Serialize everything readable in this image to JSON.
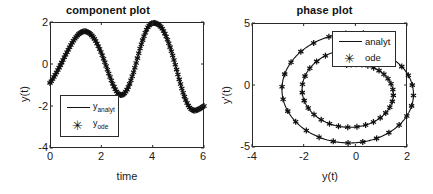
{
  "figure": {
    "background_color": "#ffffff",
    "line_color": "#111111",
    "marker_glyph": "✳"
  },
  "chart_data": [
    {
      "type": "line",
      "id": "component-plot",
      "title": "component plot",
      "xlabel": "time",
      "ylabel": "y(t)",
      "xlim": [
        0,
        6
      ],
      "ylim": [
        -4,
        2
      ],
      "xticks": [
        0,
        2,
        4,
        6
      ],
      "yticks": [
        -4,
        -2,
        0,
        2
      ],
      "grid": false,
      "legend": {
        "position": "lower-left-inside",
        "entries": [
          {
            "label": "y",
            "sub": "analyt",
            "style": "line"
          },
          {
            "label": "y",
            "sub": "ode",
            "style": "marker"
          }
        ]
      },
      "description": "Damped-amplitude growing oscillation y(t) starting near -0.9 at t=0, peaking ~1.55 at t=1.3, trough ~-1.45 at t=2.8, peak ~1.95 at t=4.25, trough ~-2.2 at t=5.8, ending ~-2.0 at t=6",
      "series": [
        {
          "name": "y_analyt",
          "style": "line",
          "x": [
            0.0,
            0.1,
            0.2,
            0.3,
            0.4,
            0.5,
            0.6,
            0.7,
            0.8,
            0.9,
            1.0,
            1.1,
            1.2,
            1.3,
            1.4,
            1.5,
            1.6,
            1.7,
            1.8,
            1.9,
            2.0,
            2.1,
            2.2,
            2.3,
            2.4,
            2.5,
            2.6,
            2.7,
            2.8,
            2.9,
            3.0,
            3.1,
            3.2,
            3.3,
            3.4,
            3.5,
            3.6,
            3.7,
            3.8,
            3.9,
            4.0,
            4.1,
            4.2,
            4.3,
            4.4,
            4.5,
            4.6,
            4.7,
            4.8,
            4.9,
            5.0,
            5.1,
            5.2,
            5.3,
            5.4,
            5.5,
            5.6,
            5.7,
            5.8,
            5.9,
            6.0
          ],
          "y": [
            -0.9,
            -0.72,
            -0.52,
            -0.3,
            -0.07,
            0.17,
            0.42,
            0.65,
            0.88,
            1.08,
            1.26,
            1.4,
            1.5,
            1.55,
            1.55,
            1.5,
            1.4,
            1.25,
            1.05,
            0.8,
            0.52,
            0.2,
            -0.14,
            -0.49,
            -0.82,
            -1.1,
            -1.32,
            -1.45,
            -1.48,
            -1.4,
            -1.22,
            -0.95,
            -0.6,
            -0.2,
            0.25,
            0.7,
            1.1,
            1.45,
            1.72,
            1.88,
            1.95,
            1.95,
            1.9,
            1.8,
            1.62,
            1.38,
            1.08,
            0.72,
            0.32,
            -0.12,
            -0.58,
            -1.02,
            -1.42,
            -1.75,
            -2.0,
            -2.15,
            -2.22,
            -2.2,
            -2.15,
            -2.08,
            -2.0
          ]
        },
        {
          "name": "y_ode",
          "style": "marker",
          "x": [
            0.0,
            0.1,
            0.2,
            0.3,
            0.4,
            0.5,
            0.6,
            0.7,
            0.8,
            0.9,
            1.0,
            1.1,
            1.2,
            1.3,
            1.4,
            1.5,
            1.6,
            1.7,
            1.8,
            1.9,
            2.0,
            2.1,
            2.2,
            2.3,
            2.4,
            2.5,
            2.6,
            2.7,
            2.8,
            2.9,
            3.0,
            3.1,
            3.2,
            3.3,
            3.4,
            3.5,
            3.6,
            3.7,
            3.8,
            3.9,
            4.0,
            4.1,
            4.2,
            4.3,
            4.4,
            4.5,
            4.6,
            4.7,
            4.8,
            4.9,
            5.0,
            5.1,
            5.2,
            5.3,
            5.4,
            5.5,
            5.6,
            5.7,
            5.8,
            5.9,
            6.0
          ],
          "y": [
            -0.9,
            -0.72,
            -0.52,
            -0.3,
            -0.07,
            0.17,
            0.42,
            0.65,
            0.88,
            1.08,
            1.26,
            1.4,
            1.5,
            1.55,
            1.55,
            1.5,
            1.4,
            1.25,
            1.05,
            0.8,
            0.52,
            0.2,
            -0.14,
            -0.49,
            -0.82,
            -1.1,
            -1.32,
            -1.45,
            -1.48,
            -1.4,
            -1.22,
            -0.95,
            -0.6,
            -0.2,
            0.25,
            0.7,
            1.1,
            1.45,
            1.72,
            1.88,
            1.95,
            1.95,
            1.9,
            1.8,
            1.62,
            1.38,
            1.08,
            0.72,
            0.32,
            -0.12,
            -0.58,
            -1.02,
            -1.42,
            -1.75,
            -2.0,
            -2.15,
            -2.22,
            -2.2,
            -2.15,
            -2.08,
            -2.0
          ]
        }
      ]
    },
    {
      "type": "scatter",
      "id": "phase-plot",
      "title": "phase plot",
      "xlabel": "y(t)",
      "ylabel": "y'(t)",
      "xlim": [
        -4,
        2
      ],
      "ylim": [
        -5,
        5
      ],
      "xticks": [
        -4,
        -2,
        0,
        2
      ],
      "yticks": [
        -5,
        0,
        5
      ],
      "grid": false,
      "legend": {
        "position": "upper-right-inside",
        "entries": [
          {
            "label": "analyt",
            "style": "line"
          },
          {
            "label": "ode",
            "style": "marker"
          }
        ]
      },
      "description": "Outward spiral in phase space starting near (-0.85, 1.6), winding counter-clockwise with growing radius; inner loop radius ~1.7, outer loop radius ~2.9 about center (-0.1,-0.6)",
      "series": [
        {
          "name": "analyt",
          "style": "line",
          "spiral": {
            "center": [
              -0.1,
              -0.55
            ],
            "start_angle_deg": 100,
            "turns": 2.05,
            "r_start": 1.35,
            "r_end": 2.95,
            "direction": "clockwise",
            "y_scale": 1.62
          }
        },
        {
          "name": "ode",
          "style": "marker",
          "spiral": {
            "center": [
              -0.1,
              -0.55
            ],
            "start_angle_deg": 100,
            "turns": 2.05,
            "r_start": 1.35,
            "r_end": 2.95,
            "direction": "clockwise",
            "y_scale": 1.62,
            "n_markers": 62
          }
        }
      ]
    }
  ]
}
